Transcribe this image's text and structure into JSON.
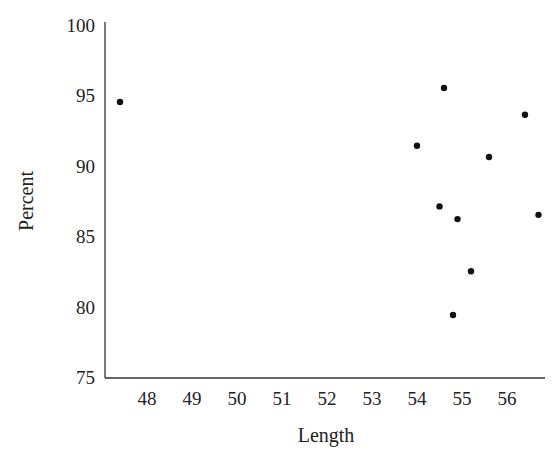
{
  "chart_data": {
    "type": "scatter",
    "title": "",
    "xlabel": "Length",
    "ylabel": "Percent",
    "xlim": [
      47.1,
      56.8
    ],
    "ylim": [
      75,
      100
    ],
    "x_ticks": [
      48,
      49,
      50,
      51,
      52,
      53,
      54,
      55,
      56
    ],
    "y_ticks": [
      75,
      80,
      85,
      90,
      95,
      100
    ],
    "grid": false,
    "legend": null,
    "points": [
      {
        "x": 47.4,
        "y": 94.5
      },
      {
        "x": 54.6,
        "y": 95.5
      },
      {
        "x": 54.0,
        "y": 91.4
      },
      {
        "x": 56.4,
        "y": 93.6
      },
      {
        "x": 55.6,
        "y": 90.6
      },
      {
        "x": 54.5,
        "y": 87.1
      },
      {
        "x": 54.9,
        "y": 86.2
      },
      {
        "x": 56.7,
        "y": 86.5
      },
      {
        "x": 55.2,
        "y": 82.5
      },
      {
        "x": 54.8,
        "y": 79.4
      }
    ],
    "marker_color": "#111111"
  }
}
